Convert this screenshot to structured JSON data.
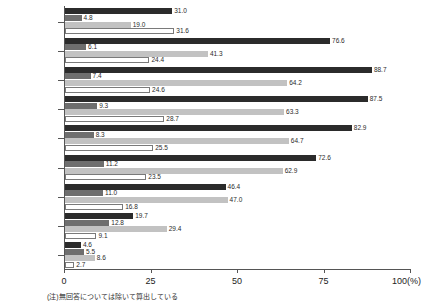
{
  "chart_data": {
    "type": "bar",
    "orientation": "horizontal",
    "title": "",
    "xlabel": "100(%)",
    "ylabel": "",
    "xlim": [
      0,
      100
    ],
    "xticks": [
      "0",
      "25",
      "50",
      "75",
      "100(%)"
    ],
    "xtick_values": [
      0,
      25,
      50,
      75,
      100
    ],
    "grid": false,
    "legend": "none",
    "categories": [
      "6～12歳",
      "13～19歳",
      "20～29歳",
      "30～39歳",
      "40～49歳",
      "50～59歳",
      "60～69歳",
      "70～79歳",
      "80歳以上"
    ],
    "series": [
      {
        "name": "series-1",
        "color": "#2b2b2b",
        "values": [
          31.0,
          76.6,
          88.7,
          87.5,
          82.9,
          72.6,
          46.4,
          19.7,
          4.6
        ]
      },
      {
        "name": "series-2",
        "color": "#6e6e6e",
        "values": [
          4.8,
          6.1,
          7.4,
          9.3,
          8.3,
          11.2,
          11.0,
          12.8,
          5.5
        ]
      },
      {
        "name": "series-3",
        "color": "#c2c2c2",
        "values": [
          19.0,
          41.3,
          64.2,
          63.3,
          64.7,
          62.9,
          47.0,
          29.4,
          8.6
        ]
      },
      {
        "name": "series-4",
        "color": "#ffffff",
        "values": [
          31.6,
          24.4,
          24.6,
          28.7,
          25.5,
          23.5,
          16.8,
          9.1,
          2.7
        ]
      }
    ],
    "value_labels": [
      [
        "31.0",
        "4.8",
        "19.0",
        "31.6"
      ],
      [
        "76.6",
        "6.1",
        "41.3",
        "24.4"
      ],
      [
        "88.7",
        "7.4",
        "64.2",
        "24.6"
      ],
      [
        "87.5",
        "9.3",
        "63.3",
        "28.7"
      ],
      [
        "82.9",
        "8.3",
        "64.7",
        "25.5"
      ],
      [
        "72.6",
        "11.2",
        "62.9",
        "23.5"
      ],
      [
        "46.4",
        "11.0",
        "47.0",
        "16.8"
      ],
      [
        "19.7",
        "12.8",
        "29.4",
        "9.1"
      ],
      [
        "4.6",
        "5.5",
        "8.6",
        "2.7"
      ]
    ],
    "footnote": "(注)無回答については除いて算出している"
  }
}
